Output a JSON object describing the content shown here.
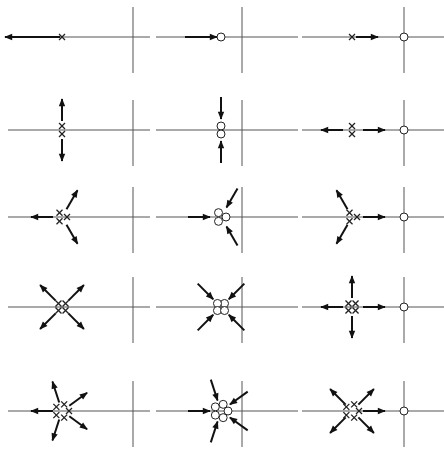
{
  "figure": {
    "title": "",
    "glyphs": {
      "pole": "×",
      "zero": "○"
    },
    "colors": {
      "ink": "#111111",
      "axis": "#555555",
      "background": "#ffffff"
    },
    "rows": [
      {
        "order": 1,
        "panels": [
          {
            "type": "poles",
            "count": 1,
            "asymptote_angles_deg": [
              180
            ],
            "direction": "outward"
          },
          {
            "type": "zeros",
            "count": 1,
            "asymptote_angles_deg": [
              180
            ],
            "direction": "inward"
          },
          {
            "type": "poles-with-zero",
            "count": 1,
            "zero_at_origin": true,
            "to_zero": true,
            "asymptote_angles_deg": []
          }
        ]
      },
      {
        "order": 2,
        "panels": [
          {
            "type": "poles",
            "count": 2,
            "asymptote_angles_deg": [
              90,
              270
            ],
            "direction": "outward"
          },
          {
            "type": "zeros",
            "count": 2,
            "asymptote_angles_deg": [
              90,
              270
            ],
            "direction": "inward"
          },
          {
            "type": "poles-with-zero",
            "count": 2,
            "zero_at_origin": true,
            "to_zero": true,
            "asymptote_angles_deg": [
              180
            ]
          }
        ]
      },
      {
        "order": 3,
        "panels": [
          {
            "type": "poles",
            "count": 3,
            "asymptote_angles_deg": [
              60,
              180,
              300
            ],
            "direction": "outward"
          },
          {
            "type": "zeros",
            "count": 3,
            "asymptote_angles_deg": [
              60,
              180,
              300
            ],
            "direction": "inward"
          },
          {
            "type": "poles-with-zero",
            "count": 3,
            "zero_at_origin": true,
            "to_zero": true,
            "asymptote_angles_deg": [
              120,
              240
            ]
          }
        ]
      },
      {
        "order": 4,
        "panels": [
          {
            "type": "poles",
            "count": 4,
            "asymptote_angles_deg": [
              45,
              135,
              225,
              315
            ],
            "direction": "outward"
          },
          {
            "type": "zeros",
            "count": 4,
            "asymptote_angles_deg": [
              45,
              135,
              225,
              315
            ],
            "direction": "inward"
          },
          {
            "type": "poles-with-zero",
            "count": 4,
            "zero_at_origin": true,
            "to_zero": true,
            "asymptote_angles_deg": [
              90,
              180,
              270
            ]
          }
        ]
      },
      {
        "order": 5,
        "panels": [
          {
            "type": "poles",
            "count": 5,
            "asymptote_angles_deg": [
              36,
              108,
              180,
              252,
              324
            ],
            "direction": "outward"
          },
          {
            "type": "zeros",
            "count": 5,
            "asymptote_angles_deg": [
              36,
              108,
              180,
              252,
              324
            ],
            "direction": "inward"
          },
          {
            "type": "poles-with-zero",
            "count": 5,
            "zero_at_origin": true,
            "to_zero": true,
            "asymptote_angles_deg": [
              45,
              135,
              225,
              315
            ]
          }
        ]
      }
    ]
  }
}
